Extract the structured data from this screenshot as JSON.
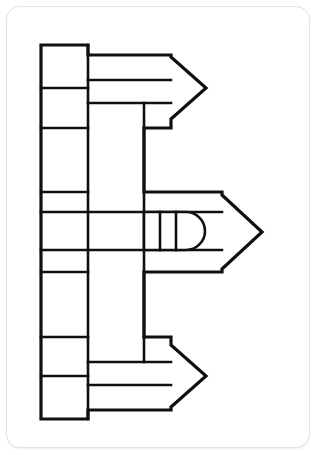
{
  "page": {
    "title": "Letter B Block Arrow Line Art",
    "width": 318,
    "height": 455,
    "background_color": "#ffffff"
  },
  "card": {
    "name": "artwork-card",
    "background_color": "#ffffff",
    "border_color": "#e2e2e2",
    "border_radius_px": 14,
    "x": 6,
    "y": 6,
    "width": 304,
    "height": 442
  },
  "artwork": {
    "name": "block-letter-b-arrows",
    "description": "Black outline line-art drawing of a letter B formed from rectangular blocks with three right-pointing arrowheads",
    "stroke_color": "#101010",
    "fill_color": "#ffffff",
    "stroke_width_outer": 3.2,
    "stroke_width_inner": 2.6,
    "viewbox": "0 0 318 455",
    "outline_path": "M41 45 L88 45 L88 55 L171 55 L171 57 L206 88 L171 119 L171 128 L144 128 L144 192 L222 192 L222 195 L262 232 L222 269 L222 272 L144 272 L144 337 L171 337 L171 345 L206 376 L171 407 L171 410 L88 410 L88 419 L41 419 Z",
    "inner_segments": [
      {
        "name": "left-col-divider-1",
        "type": "line",
        "x1": 41,
        "y1": 88,
        "x2": 88,
        "y2": 88
      },
      {
        "name": "left-col-divider-2",
        "type": "line",
        "x1": 41,
        "y1": 128,
        "x2": 88,
        "y2": 128
      },
      {
        "name": "left-col-divider-3",
        "type": "line",
        "x1": 41,
        "y1": 192,
        "x2": 88,
        "y2": 192
      },
      {
        "name": "left-col-divider-4",
        "type": "line",
        "x1": 41,
        "y1": 212,
        "x2": 88,
        "y2": 212
      },
      {
        "name": "left-col-divider-5",
        "type": "line",
        "x1": 41,
        "y1": 250,
        "x2": 88,
        "y2": 250
      },
      {
        "name": "left-col-divider-6",
        "type": "line",
        "x1": 41,
        "y1": 272,
        "x2": 88,
        "y2": 272
      },
      {
        "name": "left-col-divider-7",
        "type": "line",
        "x1": 41,
        "y1": 337,
        "x2": 88,
        "y2": 337
      },
      {
        "name": "left-col-divider-8",
        "type": "line",
        "x1": 41,
        "y1": 376,
        "x2": 88,
        "y2": 376
      },
      {
        "name": "column-rule-left",
        "type": "line",
        "x1": 88,
        "y1": 45,
        "x2": 88,
        "y2": 419
      },
      {
        "name": "column-rule-mid",
        "type": "line",
        "x1": 144,
        "y1": 128,
        "x2": 144,
        "y2": 337
      },
      {
        "name": "upper-band-row-1",
        "type": "line",
        "x1": 88,
        "y1": 80,
        "x2": 171,
        "y2": 80
      },
      {
        "name": "upper-band-row-2",
        "type": "line",
        "x1": 88,
        "y1": 103,
        "x2": 171,
        "y2": 103
      },
      {
        "name": "upper-band-stub",
        "type": "line",
        "x1": 144,
        "y1": 103,
        "x2": 144,
        "y2": 128
      },
      {
        "name": "mid-band-row-1",
        "type": "line",
        "x1": 88,
        "y1": 212,
        "x2": 222,
        "y2": 212
      },
      {
        "name": "mid-band-row-2",
        "type": "line",
        "x1": 88,
        "y1": 250,
        "x2": 222,
        "y2": 250
      },
      {
        "name": "lower-band-row-1",
        "type": "line",
        "x1": 88,
        "y1": 362,
        "x2": 171,
        "y2": 362
      },
      {
        "name": "lower-band-row-2",
        "type": "line",
        "x1": 88,
        "y1": 385,
        "x2": 171,
        "y2": 385
      },
      {
        "name": "lower-band-stub",
        "type": "line",
        "x1": 144,
        "y1": 337,
        "x2": 144,
        "y2": 362
      },
      {
        "name": "bowl-slot-rule-1",
        "type": "line",
        "x1": 160,
        "y1": 212,
        "x2": 160,
        "y2": 250
      },
      {
        "name": "bowl-slot-rule-2",
        "type": "line",
        "x1": 176,
        "y1": 212,
        "x2": 176,
        "y2": 250
      }
    ],
    "rounded_slot": {
      "name": "rounded-bowl-slot",
      "path": "M144 212 L186 212 A19 19 0 0 1 186 250 L144 250 Z",
      "corner_radius": 19
    },
    "arrowheads": [
      {
        "name": "arrowhead-top",
        "tip_x": 206,
        "tip_y": 88,
        "base_x": 171,
        "top_y": 55,
        "bottom_y": 119
      },
      {
        "name": "arrowhead-middle",
        "tip_x": 262,
        "tip_y": 232,
        "base_x": 222,
        "top_y": 192,
        "bottom_y": 272
      },
      {
        "name": "arrowhead-bottom",
        "tip_x": 206,
        "tip_y": 376,
        "base_x": 171,
        "top_y": 345,
        "bottom_y": 407
      }
    ]
  }
}
